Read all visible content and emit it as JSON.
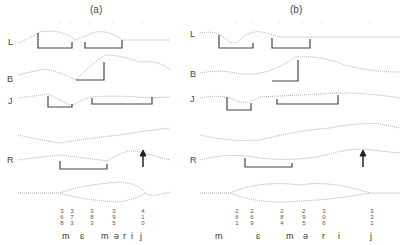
{
  "panels": [
    {
      "title": "(a)",
      "row_labels": [
        "L",
        "B",
        "J",
        "R"
      ],
      "tick_values": [
        "368",
        "373",
        "383",
        "395",
        "410"
      ],
      "phonemes": [
        "m",
        "ɛ",
        "m",
        "ə",
        "r",
        "i",
        "j"
      ]
    },
    {
      "title": "(b)",
      "row_labels": [
        "L",
        "B",
        "J",
        "R"
      ],
      "tick_values": [
        "261",
        "269",
        "284",
        "295",
        "306",
        "331"
      ],
      "phonemes": [
        "m",
        "ɛ",
        "m",
        "ə",
        "r",
        "i",
        "j"
      ]
    }
  ]
}
